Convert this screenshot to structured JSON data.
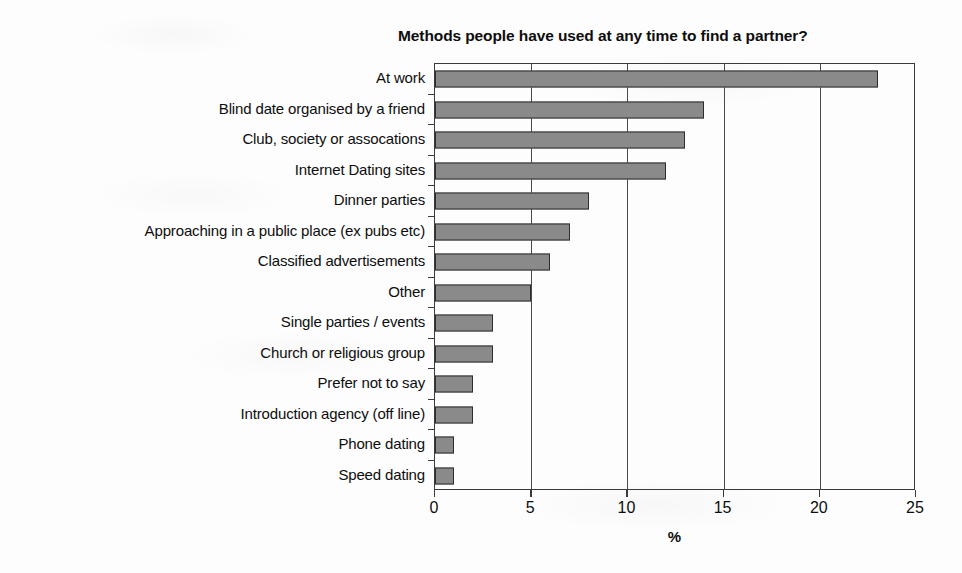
{
  "chart_data": {
    "type": "bar",
    "orientation": "horizontal",
    "title": "Methods people have used at any time to find a partner?",
    "xlabel": "%",
    "ylabel": "",
    "xlim": [
      0,
      25
    ],
    "xticks": [
      0,
      5,
      10,
      15,
      20,
      25
    ],
    "grid": "vertical",
    "legend": "none",
    "categories": [
      "At work",
      "Blind date organised by a friend",
      "Club, society or assocations",
      "Internet Dating sites",
      "Dinner parties",
      "Approaching in a public place (ex pubs etc)",
      "Classified advertisements",
      "Other",
      "Single parties / events",
      "Church or religious group",
      "Prefer not to say",
      "Introduction agency (off line)",
      "Phone dating",
      "Speed dating"
    ],
    "values": [
      23,
      14,
      13,
      12,
      8,
      7,
      6,
      5,
      3,
      3,
      2,
      2,
      1,
      1
    ],
    "bar_color": "#8a8a8a",
    "bar_border_color": "#2d2d2d",
    "axis_color": "#3a3a3a"
  }
}
